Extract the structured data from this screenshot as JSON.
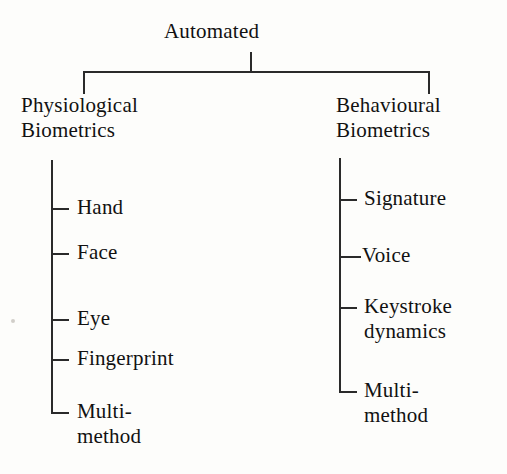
{
  "diagram": {
    "title": "Automated",
    "root": {
      "label": "Automated"
    },
    "branches": [
      {
        "id": "physiological",
        "label_line1": "Physiological",
        "label_line2": "Biometrics",
        "leaves": [
          {
            "line1": "Hand",
            "line2": ""
          },
          {
            "line1": "Face",
            "line2": ""
          },
          {
            "line1": "Eye",
            "line2": ""
          },
          {
            "line1": "Fingerprint",
            "line2": ""
          },
          {
            "line1": "Multi-",
            "line2": "method"
          }
        ]
      },
      {
        "id": "behavioural",
        "label_line1": "Behavioural",
        "label_line2": "Biometrics",
        "leaves": [
          {
            "line1": "Signature",
            "line2": ""
          },
          {
            "line1": "Voice",
            "line2": ""
          },
          {
            "line1": "Keystroke",
            "line2": "dynamics"
          },
          {
            "line1": "Multi-",
            "line2": "method"
          }
        ]
      }
    ],
    "colors": {
      "line": "#2a2a2a",
      "text": "#111111",
      "background": "#fdfdfb"
    }
  }
}
